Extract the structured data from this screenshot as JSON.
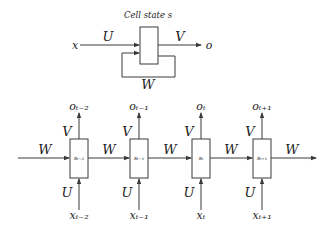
{
  "folded": {
    "title": "Cell state s",
    "input_label": "x",
    "input_weight": "U",
    "output_weight": "V",
    "output_label": "o",
    "recurrent_weight": "W"
  },
  "unfolded": {
    "recurrent_weight": "W",
    "input_weight": "U",
    "output_weight": "V",
    "steps": [
      {
        "state": "sₜ₋₂",
        "input": "xₜ₋₂",
        "output": "oₜ₋₂",
        "state_plain": "st-2",
        "input_plain": "xt-2",
        "output_plain": "ot-2"
      },
      {
        "state": "sₜ₋₁",
        "input": "xₜ₋₁",
        "output": "oₜ₋₁",
        "state_plain": "st-1",
        "input_plain": "xt-1",
        "output_plain": "ot-1"
      },
      {
        "state": "sₜ",
        "input": "xₜ",
        "output": "oₜ",
        "state_plain": "st",
        "input_plain": "xt",
        "output_plain": "ot"
      },
      {
        "state": "sₜ₊₁",
        "input": "xₜ₊₁",
        "output": "oₜ₊₁",
        "state_plain": "st+1",
        "input_plain": "xt+1",
        "output_plain": "ot+1"
      }
    ]
  },
  "colors": {
    "line": "#3a3a3a",
    "text": "#222222",
    "background": "#ffffff"
  }
}
